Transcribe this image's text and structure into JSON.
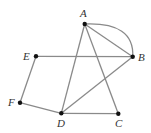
{
  "diagram": {
    "type": "graph",
    "vertices": [
      {
        "id": "A",
        "label": "A",
        "x": 84.7,
        "y": 24.0,
        "lx": 80,
        "ly": 17
      },
      {
        "id": "B",
        "label": "B",
        "x": 132.7,
        "y": 56.7,
        "lx": 138,
        "ly": 61
      },
      {
        "id": "C",
        "label": "C",
        "x": 118.3,
        "y": 113.7,
        "lx": 115,
        "ly": 127
      },
      {
        "id": "D",
        "label": "D",
        "x": 61.3,
        "y": 113.3,
        "lx": 57,
        "ly": 127
      },
      {
        "id": "E",
        "label": "E",
        "x": 36.0,
        "y": 56.3,
        "lx": 23,
        "ly": 60
      },
      {
        "id": "F",
        "label": "F",
        "x": 20.0,
        "y": 102.7,
        "lx": 8,
        "ly": 106
      }
    ],
    "edges": [
      {
        "from": "A",
        "to": "B",
        "shape": "line"
      },
      {
        "from": "A",
        "to": "B",
        "shape": "arc"
      },
      {
        "from": "A",
        "to": "D",
        "shape": "line"
      },
      {
        "from": "A",
        "to": "C",
        "shape": "line"
      },
      {
        "from": "E",
        "to": "B",
        "shape": "line"
      },
      {
        "from": "B",
        "to": "D",
        "shape": "line"
      },
      {
        "from": "E",
        "to": "F",
        "shape": "line"
      },
      {
        "from": "F",
        "to": "D",
        "shape": "line"
      },
      {
        "from": "D",
        "to": "C",
        "shape": "line"
      }
    ],
    "colors": {
      "edge": "#8a8a8a",
      "vertex": "#111111",
      "label": "#333333"
    }
  }
}
